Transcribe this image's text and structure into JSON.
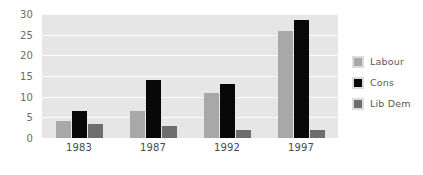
{
  "chart_data": {
    "type": "bar",
    "title": "",
    "xlabel": "",
    "ylabel": "",
    "categories": [
      "1983",
      "1987",
      "1992",
      "1997"
    ],
    "series": [
      {
        "name": "Labour",
        "color": "#a8a8a8",
        "values": [
          4,
          6.5,
          11,
          26
        ]
      },
      {
        "name": "Cons",
        "color": "#080808",
        "values": [
          6.5,
          14,
          13,
          28.5
        ]
      },
      {
        "name": "Lib Dem",
        "color": "#6e6e6e",
        "values": [
          3.5,
          3,
          2,
          2
        ]
      }
    ],
    "ylim": [
      0,
      30
    ],
    "yticks": [
      0,
      5,
      10,
      15,
      20,
      25,
      30
    ],
    "ytick_labels": [
      "0",
      "5",
      "10",
      "15",
      "20",
      "25",
      "30"
    ],
    "grid": true,
    "grid_color": "#fbfbfb",
    "plot_background": "#e6e6e6",
    "legend_position": "right"
  },
  "legend": {
    "items": [
      {
        "label": "Labour",
        "swatch_name": "legend-swatch-labour"
      },
      {
        "label": "Cons",
        "swatch_name": "legend-swatch-cons"
      },
      {
        "label": "Lib Dem",
        "swatch_name": "legend-swatch-lib-dem"
      }
    ]
  }
}
